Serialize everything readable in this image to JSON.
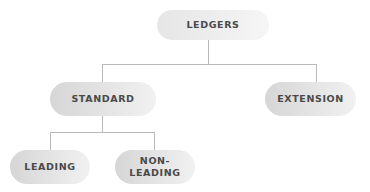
{
  "diagram": {
    "type": "tree",
    "root": {
      "label": "LEDGERS",
      "children": [
        {
          "label": "STANDARD",
          "children": [
            {
              "label": "LEADING"
            },
            {
              "label": "NON-\nLEADING"
            }
          ]
        },
        {
          "label": "EXTENSION"
        }
      ]
    }
  },
  "nodes": {
    "ledgers": "LEDGERS",
    "standard": "STANDARD",
    "extension": "EXTENSION",
    "leading": "LEADING",
    "non_leading_line1": "NON-",
    "non_leading_line2": "LEADING"
  },
  "colors": {
    "pill_fill_dark": "#d6d6d6",
    "pill_fill_light": "#f1f1f1",
    "text": "#4a4a4a",
    "connector": "#b9b9b9"
  }
}
